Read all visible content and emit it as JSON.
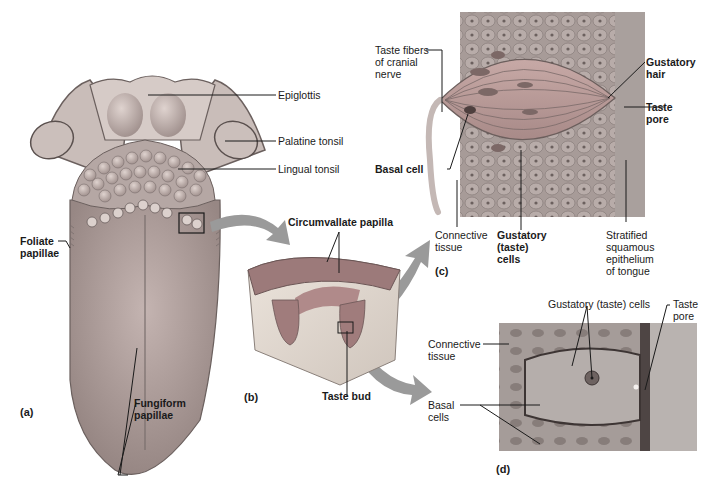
{
  "figure": {
    "panel_a": {
      "letter": "(a)",
      "labels": {
        "epiglottis": "Epiglottis",
        "palatine_tonsil": "Palatine tonsil",
        "lingual_tonsil": "Lingual tonsil",
        "foliate_papillae": "Foliate\npapillae",
        "fungiform_papillae": "Fungiform\npapillae"
      }
    },
    "panel_b": {
      "letter": "(b)",
      "labels": {
        "circumvallate_papilla": "Circumvallate papilla",
        "taste_bud": "Taste bud"
      }
    },
    "panel_c": {
      "letter": "(c)",
      "labels": {
        "taste_fibers": "Taste fibers\nof cranial\nnerve",
        "basal_cell": "Basal cell",
        "connective_tissue": "Connective\ntissue",
        "gustatory_cells": "Gustatory\n(taste)\ncells",
        "stratified_epithelium": "Stratified\nsquamous\nepithelium\nof tongue",
        "gustatory_hair": "Gustatory\nhair",
        "taste_pore": "Taste\npore"
      }
    },
    "panel_d": {
      "letter": "(d)",
      "labels": {
        "gustatory_cells": "Gustatory (taste) cells",
        "taste_pore": "Taste\npore",
        "connective_tissue": "Connective\ntissue",
        "basal_cells": "Basal\ncells"
      }
    },
    "colors": {
      "tongue": "#b9a9a6",
      "tongue_dark": "#8f807d",
      "tissue_pink": "#c99aa0",
      "connective": "#e8e0d8",
      "arrow": "#9a9a9a",
      "leader": "#1a1a1a"
    }
  }
}
